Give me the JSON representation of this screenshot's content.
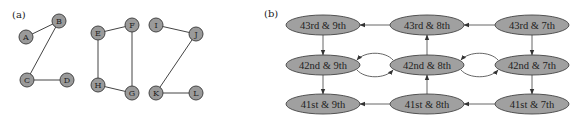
{
  "panel_a": {
    "label": "(a)",
    "nodes": [
      {
        "id": "A",
        "label": "A",
        "x": 26,
        "y": 37
      },
      {
        "id": "B",
        "label": "B",
        "x": 59,
        "y": 21
      },
      {
        "id": "C",
        "label": "C",
        "x": 27,
        "y": 80
      },
      {
        "id": "D",
        "label": "D",
        "x": 67,
        "y": 80
      },
      {
        "id": "E",
        "label": "E",
        "x": 98,
        "y": 33
      },
      {
        "id": "F",
        "label": "F",
        "x": 132,
        "y": 25
      },
      {
        "id": "G",
        "label": "G",
        "x": 132,
        "y": 93
      },
      {
        "id": "H",
        "label": "H",
        "x": 98,
        "y": 85
      },
      {
        "id": "I",
        "label": "I",
        "x": 156,
        "y": 25
      },
      {
        "id": "J",
        "label": "J",
        "x": 196,
        "y": 34
      },
      {
        "id": "K",
        "label": "K",
        "x": 156,
        "y": 93
      },
      {
        "id": "L",
        "label": "L",
        "x": 196,
        "y": 93
      }
    ],
    "edges": [
      [
        "A",
        "B"
      ],
      [
        "B",
        "C"
      ],
      [
        "C",
        "D"
      ],
      [
        "E",
        "F"
      ],
      [
        "E",
        "H"
      ],
      [
        "F",
        "G"
      ],
      [
        "H",
        "G"
      ],
      [
        "I",
        "J"
      ],
      [
        "J",
        "K"
      ],
      [
        "K",
        "L"
      ]
    ]
  },
  "panel_b": {
    "label": "(b)",
    "nodes": [
      {
        "id": "n43_9",
        "label": "43rd & 9th",
        "x": 323,
        "y": 25
      },
      {
        "id": "n43_8",
        "label": "43rd & 8th",
        "x": 427,
        "y": 25
      },
      {
        "id": "n43_7",
        "label": "43rd & 7th",
        "x": 532,
        "y": 25
      },
      {
        "id": "n42_9",
        "label": "42nd & 9th",
        "x": 323,
        "y": 65
      },
      {
        "id": "n42_8",
        "label": "42nd & 8th",
        "x": 427,
        "y": 65
      },
      {
        "id": "n42_7",
        "label": "42nd & 7th",
        "x": 532,
        "y": 65
      },
      {
        "id": "n41_9",
        "label": "41st & 9th",
        "x": 323,
        "y": 104
      },
      {
        "id": "n41_8",
        "label": "41st & 8th",
        "x": 427,
        "y": 104
      },
      {
        "id": "n41_7",
        "label": "41st & 7th",
        "x": 532,
        "y": 104
      }
    ],
    "edges": [
      {
        "from": "n43_8",
        "to": "n43_9"
      },
      {
        "from": "n43_7",
        "to": "n43_8"
      },
      {
        "from": "n43_9",
        "to": "n42_9"
      },
      {
        "from": "n42_8",
        "to": "n43_8"
      },
      {
        "from": "n43_7",
        "to": "n42_7"
      },
      {
        "from": "n42_9",
        "to": "n42_8",
        "curved": "below"
      },
      {
        "from": "n42_8",
        "to": "n42_9",
        "curved": "above"
      },
      {
        "from": "n42_8",
        "to": "n42_7",
        "curved": "below"
      },
      {
        "from": "n42_7",
        "to": "n42_8",
        "curved": "above"
      },
      {
        "from": "n42_9",
        "to": "n41_9"
      },
      {
        "from": "n41_8",
        "to": "n42_8"
      },
      {
        "from": "n42_7",
        "to": "n41_7"
      },
      {
        "from": "n41_8",
        "to": "n41_9"
      },
      {
        "from": "n41_7",
        "to": "n41_8"
      }
    ]
  },
  "colors": {
    "node_fill_a": "#9a9a9a",
    "node_fill_b": "#a0a0a0",
    "stroke": "#444444"
  }
}
